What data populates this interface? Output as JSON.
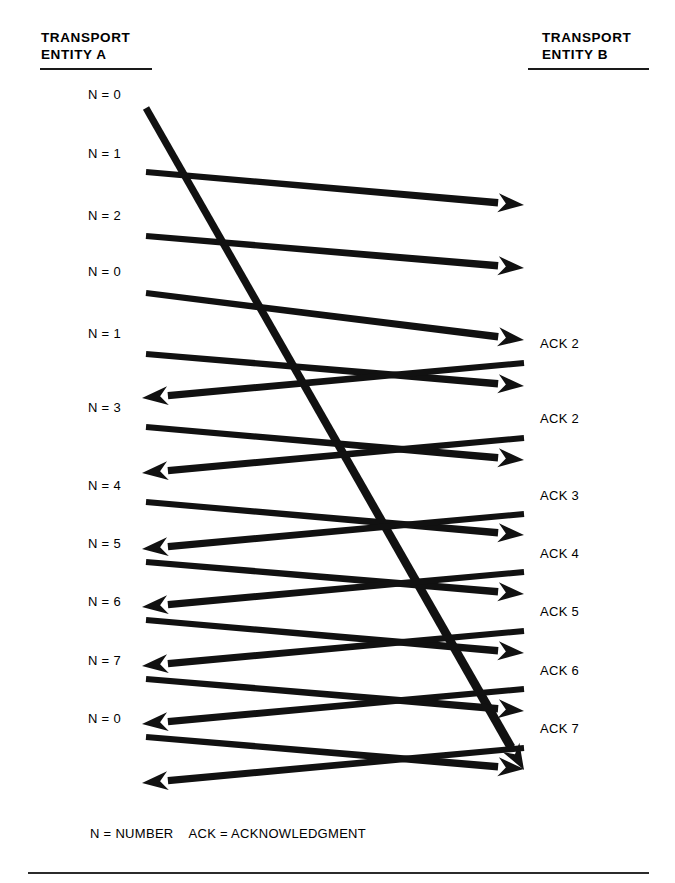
{
  "diagram": {
    "title_left": "TRANSPORT\nENTITY A",
    "title_right": "TRANSPORT\nENTITY B",
    "legend": "N = NUMBER    ACK = ACKNOWLEDGMENT",
    "stroke_color": "#111111",
    "background_color": "#ffffff"
  },
  "left_labels": [
    {
      "text": "N = 0",
      "x": 88,
      "y": 88
    },
    {
      "text": "N = 1",
      "x": 88,
      "y": 147
    },
    {
      "text": "N = 2",
      "x": 88,
      "y": 209
    },
    {
      "text": "N = 0",
      "x": 88,
      "y": 265
    },
    {
      "text": "N = 1",
      "x": 88,
      "y": 327
    },
    {
      "text": "N = 3",
      "x": 88,
      "y": 401
    },
    {
      "text": "N = 4",
      "x": 88,
      "y": 479
    },
    {
      "text": "N = 5",
      "x": 88,
      "y": 537
    },
    {
      "text": "N = 6",
      "x": 88,
      "y": 595
    },
    {
      "text": "N = 7",
      "x": 88,
      "y": 654
    },
    {
      "text": "N = 0",
      "x": 88,
      "y": 712
    }
  ],
  "right_labels": [
    {
      "text": "ACK 2",
      "x": 540,
      "y": 337
    },
    {
      "text": "ACK 2",
      "x": 540,
      "y": 412
    },
    {
      "text": "ACK 3",
      "x": 540,
      "y": 489
    },
    {
      "text": "ACK 4",
      "x": 540,
      "y": 547
    },
    {
      "text": "ACK 5",
      "x": 540,
      "y": 605
    },
    {
      "text": "ACK 6",
      "x": 540,
      "y": 664
    },
    {
      "text": "ACK 7",
      "x": 540,
      "y": 722
    }
  ],
  "arrows": [
    {
      "name": "data-n0-long",
      "direction": "right",
      "x1": 146,
      "y1": 108,
      "x2": 524,
      "y2": 770,
      "width": 9,
      "label": "N = 0"
    },
    {
      "name": "data-n1",
      "direction": "right",
      "x1": 146,
      "y1": 172,
      "x2": 524,
      "y2": 205,
      "width": 7.5,
      "label": "N = 1"
    },
    {
      "name": "data-n2",
      "direction": "right",
      "x1": 146,
      "y1": 236,
      "x2": 524,
      "y2": 268,
      "width": 7.5,
      "label": "N = 2"
    },
    {
      "name": "data-n0-retx",
      "direction": "right",
      "x1": 146,
      "y1": 293,
      "x2": 524,
      "y2": 340,
      "width": 7.5,
      "label": "N = 0"
    },
    {
      "name": "data-n1-b",
      "direction": "right",
      "x1": 146,
      "y1": 354,
      "x2": 524,
      "y2": 386,
      "width": 7.5,
      "label": "N = 1"
    },
    {
      "name": "ack-2-a",
      "direction": "left",
      "x1": 524,
      "y1": 363,
      "x2": 142,
      "y2": 398,
      "width": 7.5,
      "label": "ACK 2"
    },
    {
      "name": "data-n3",
      "direction": "right",
      "x1": 146,
      "y1": 427,
      "x2": 524,
      "y2": 460,
      "width": 7.5,
      "label": "N = 3"
    },
    {
      "name": "ack-2-b",
      "direction": "left",
      "x1": 524,
      "y1": 438,
      "x2": 142,
      "y2": 473,
      "width": 7.5,
      "label": "ACK 2"
    },
    {
      "name": "data-n4",
      "direction": "right",
      "x1": 146,
      "y1": 502,
      "x2": 524,
      "y2": 535,
      "width": 7.5,
      "label": "N = 4"
    },
    {
      "name": "ack-3",
      "direction": "left",
      "x1": 524,
      "y1": 514,
      "x2": 142,
      "y2": 549,
      "width": 7.5,
      "label": "ACK 3"
    },
    {
      "name": "data-n5",
      "direction": "right",
      "x1": 146,
      "y1": 562,
      "x2": 524,
      "y2": 594,
      "width": 7.5,
      "label": "N = 5"
    },
    {
      "name": "ack-4",
      "direction": "left",
      "x1": 524,
      "y1": 572,
      "x2": 142,
      "y2": 607,
      "width": 7.5,
      "label": "ACK 4"
    },
    {
      "name": "data-n6",
      "direction": "right",
      "x1": 146,
      "y1": 620,
      "x2": 524,
      "y2": 653,
      "width": 7.5,
      "label": "N = 6"
    },
    {
      "name": "ack-5",
      "direction": "left",
      "x1": 524,
      "y1": 631,
      "x2": 142,
      "y2": 666,
      "width": 7.5,
      "label": "ACK 5"
    },
    {
      "name": "data-n7",
      "direction": "right",
      "x1": 146,
      "y1": 679,
      "x2": 524,
      "y2": 711,
      "width": 7.5,
      "label": "N = 7"
    },
    {
      "name": "ack-6",
      "direction": "left",
      "x1": 524,
      "y1": 689,
      "x2": 142,
      "y2": 724,
      "width": 7.5,
      "label": "ACK 6"
    },
    {
      "name": "data-n0-c",
      "direction": "right",
      "x1": 146,
      "y1": 737,
      "x2": 524,
      "y2": 769,
      "width": 7.5,
      "label": "N = 0"
    },
    {
      "name": "ack-7",
      "direction": "left",
      "x1": 524,
      "y1": 748,
      "x2": 142,
      "y2": 783,
      "width": 7.5,
      "label": "ACK 7"
    }
  ]
}
